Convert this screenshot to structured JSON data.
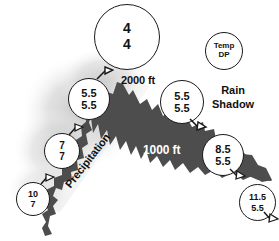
{
  "diagram": {
    "mountain_color": "#4d4d4d",
    "cloud_color": "#cfcfcf",
    "text_color": "#111111",
    "on_mountain_text_color": "#ffffff",
    "elevation_labels": [
      {
        "name": "summit-elevation",
        "text": "2000 ft"
      },
      {
        "name": "mid-elevation",
        "text": "1000 ft"
      }
    ],
    "annotations": [
      {
        "name": "precipitation-label",
        "text": "Precipitation"
      },
      {
        "name": "rain-shadow-label",
        "line1": "Rain",
        "line2": "Shadow"
      }
    ],
    "legend": {
      "name": "legend-station",
      "temp_label": "Temp",
      "dewpoint_label": "DP"
    },
    "summit_station": {
      "name": "summit-station",
      "temp": "4",
      "dewpoint": "4"
    },
    "stations": [
      {
        "name": "station-windward-upper",
        "temp": "5.5",
        "dewpoint": "5.5"
      },
      {
        "name": "station-leeward-upper",
        "temp": "5.5",
        "dewpoint": "5.5"
      },
      {
        "name": "station-windward-mid",
        "temp": "7",
        "dewpoint": "7"
      },
      {
        "name": "station-windward-base",
        "temp": "10",
        "dewpoint": "7"
      },
      {
        "name": "station-leeward-mid",
        "temp": "8.5",
        "dewpoint": "5.5"
      },
      {
        "name": "station-leeward-base",
        "temp": "11.5",
        "dewpoint": "5.5"
      }
    ]
  }
}
